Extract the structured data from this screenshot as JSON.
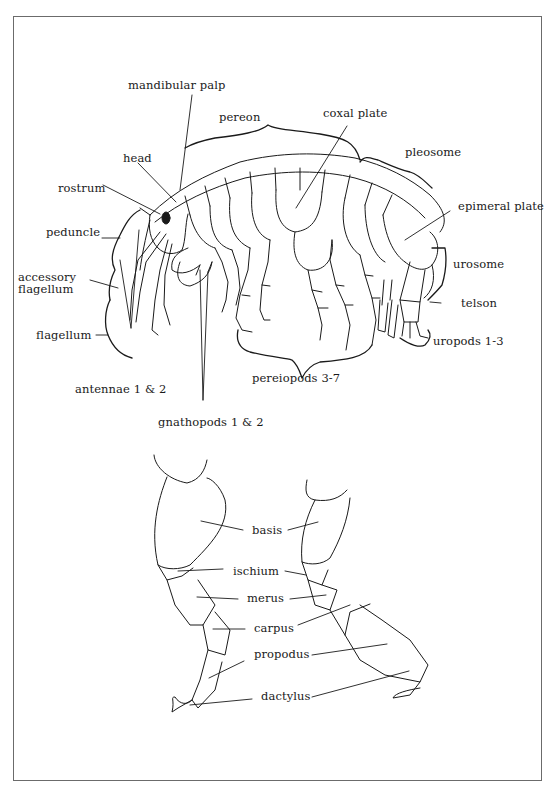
{
  "diagram": {
    "line_color": "#1a1a1a",
    "frame_color": "#6b6b6b",
    "background": "#ffffff"
  },
  "labels": {
    "mandibular_palp": "mandibular palp",
    "pereon": "pereon",
    "coxal_plate": "coxal plate",
    "pleosome": "pleosome",
    "head": "head",
    "rostrum": "rostrum",
    "epimeral_plate": "epimeral plate",
    "peduncle": "peduncle",
    "accessory_flagellum_1": "accessory",
    "accessory_flagellum_2": "flagellum",
    "urosome": "urosome",
    "telson": "telson",
    "flagellum": "flagellum",
    "uropods": "uropods 1-3",
    "antennae": "antennae 1 & 2",
    "pereiopods": "pereiopods 3-7",
    "gnathopods": "gnathopods 1 & 2"
  },
  "leg_labels": {
    "basis": "basis",
    "ischium": "ischium",
    "merus": "merus",
    "carpus": "carpus",
    "propodus": "propodus",
    "dactylus": "dactylus"
  }
}
